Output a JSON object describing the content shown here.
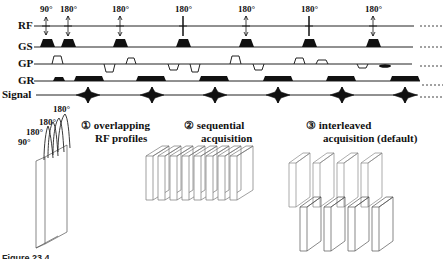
{
  "sequence": {
    "rows": [
      {
        "label": "RF",
        "y": 26
      },
      {
        "label": "GS",
        "y": 47
      },
      {
        "label": "GP",
        "y": 64
      },
      {
        "label": "GR",
        "y": 81
      },
      {
        "label": "Signal",
        "y": 95
      }
    ],
    "rf_pulses": [
      {
        "angle": "90°",
        "x": 46
      },
      {
        "angle": "180°",
        "x": 68
      },
      {
        "angle": "180°",
        "x": 120
      },
      {
        "angle": "180°",
        "x": 183
      },
      {
        "angle": "180°",
        "x": 246
      },
      {
        "angle": "180°",
        "x": 309
      },
      {
        "angle": "180°",
        "x": 373
      }
    ],
    "continuation": "......"
  },
  "panels": [
    {
      "number": "①",
      "line1": "overlapping",
      "line2": "RF profiles",
      "profile_labels": [
        "90°",
        "180°",
        "180°",
        "180°"
      ]
    },
    {
      "number": "②",
      "line1": "sequential",
      "line2": "acquisition"
    },
    {
      "number": "③",
      "line1": "interleaved",
      "line2": "acquisition (default)"
    }
  ],
  "figure_caption": "Figure 23.4"
}
